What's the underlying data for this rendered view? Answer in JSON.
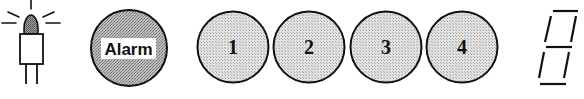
{
  "indicator_lamp": {
    "icon": "lamp-icon",
    "state": "on"
  },
  "alarm_button": {
    "label": "Alarm"
  },
  "number_buttons": [
    {
      "label": "1"
    },
    {
      "label": "2"
    },
    {
      "label": "3"
    },
    {
      "label": "4"
    }
  ],
  "seven_segment_display": {
    "value": "8",
    "segments_lit": [
      "a",
      "b",
      "c",
      "d",
      "e",
      "f",
      "g"
    ]
  },
  "colors": {
    "outline": "#111111",
    "alarm_fill": "#a8a8a8",
    "button_fill": "#d6d6d6",
    "label_bg": "#ffffff"
  }
}
